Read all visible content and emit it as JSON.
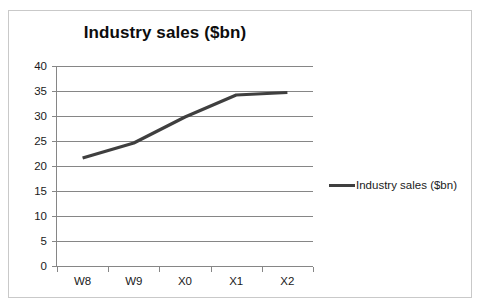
{
  "chart_data": {
    "type": "line",
    "title": "Industry sales ($bn)",
    "xlabel": "",
    "ylabel": "",
    "categories": [
      "W8",
      "W9",
      "X0",
      "X1",
      "X2"
    ],
    "series": [
      {
        "name": "Industry sales ($bn)",
        "values": [
          21.6,
          24.6,
          29.8,
          34.2,
          34.7
        ],
        "color": "#3f3f3f"
      }
    ],
    "ylim": [
      0,
      40
    ],
    "yticks": [
      0,
      5,
      10,
      15,
      20,
      25,
      30,
      35,
      40
    ],
    "ytick_labels": [
      "0",
      "5",
      "10",
      "15",
      "20",
      "25",
      "30",
      "35",
      "40"
    ],
    "grid": true,
    "grid_axis": "y",
    "legend": {
      "position": "right",
      "entries": [
        "Industry sales ($bn)"
      ]
    },
    "frame_border_color": "#c9c9c9",
    "axis_color": "#868686"
  }
}
